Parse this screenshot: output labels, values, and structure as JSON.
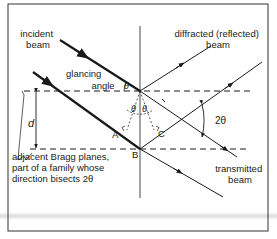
{
  "diagram": {
    "labels": {
      "incident_beam": [
        "incident",
        "beam"
      ],
      "diffracted_beam": [
        "diffracted (reflected)",
        "beam"
      ],
      "glancing_angle": [
        "glancing",
        "angle"
      ],
      "theta_glancing": "θ",
      "theta_left": "θ",
      "theta_right": "θ",
      "two_theta": "2θ",
      "spacing": "d",
      "point_a": "A",
      "point_b": "B",
      "point_c": "C",
      "transmitted_beam": [
        "transmitted",
        "beam"
      ],
      "planes_note": [
        "adjacent Bragg planes,",
        "part of a family whose",
        "direction bisects 2θ"
      ]
    },
    "colors": {
      "line": "#1a1a1a",
      "frame": "#333333",
      "background": "#ffffff"
    }
  }
}
